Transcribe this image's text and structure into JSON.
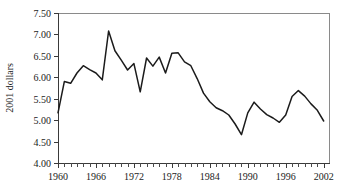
{
  "chart_data": {
    "type": "line",
    "title": "",
    "xlabel": "",
    "ylabel": "2001 dollars",
    "xlim": [
      1960,
      2003
    ],
    "ylim": [
      4.0,
      7.5
    ],
    "grid": false,
    "legend": false,
    "y_tick_labels": [
      "7.50",
      "7.00",
      "6.50",
      "6.00",
      "5.50",
      "5.00",
      "4.50",
      "4.00"
    ],
    "y_tick_values": [
      7.5,
      7.0,
      6.5,
      6.0,
      5.5,
      5.0,
      4.5,
      4.0
    ],
    "x_tick_labels": [
      "1960",
      "1966",
      "1972",
      "1978",
      "1984",
      "1990",
      "1996",
      "2002"
    ],
    "x_tick_values": [
      1960,
      1966,
      1972,
      1978,
      1984,
      1990,
      1996,
      2002
    ],
    "x_minor_tick_step": 1,
    "line_color": "#1b1b1b",
    "x": [
      1960,
      1961,
      1962,
      1963,
      1964,
      1965,
      1966,
      1967,
      1968,
      1969,
      1970,
      1971,
      1972,
      1973,
      1974,
      1975,
      1976,
      1977,
      1978,
      1979,
      1980,
      1981,
      1982,
      1983,
      1984,
      1985,
      1986,
      1987,
      1988,
      1989,
      1990,
      1991,
      1992,
      1993,
      1994,
      1995,
      1996,
      1997,
      1998,
      1999,
      2000,
      2001,
      2002
    ],
    "values": [
      5.17,
      5.9,
      5.86,
      6.1,
      6.27,
      6.18,
      6.1,
      5.94,
      7.08,
      6.62,
      6.4,
      6.17,
      6.32,
      5.66,
      6.45,
      6.26,
      6.47,
      6.1,
      6.56,
      6.57,
      6.36,
      6.27,
      5.97,
      5.63,
      5.43,
      5.29,
      5.22,
      5.12,
      4.91,
      4.66,
      5.17,
      5.42,
      5.26,
      5.13,
      5.05,
      4.95,
      5.12,
      5.55,
      5.69,
      5.56,
      5.38,
      5.23,
      4.98
    ],
    "series": [
      {
        "name": "2001 dollars",
        "values": [
          5.17,
          5.9,
          5.86,
          6.1,
          6.27,
          6.18,
          6.1,
          5.94,
          7.08,
          6.62,
          6.4,
          6.17,
          6.32,
          5.66,
          6.45,
          6.26,
          6.47,
          6.1,
          6.56,
          6.57,
          6.36,
          6.27,
          5.97,
          5.63,
          5.43,
          5.29,
          5.22,
          5.12,
          4.91,
          4.66,
          5.17,
          5.42,
          5.26,
          5.13,
          5.05,
          4.95,
          5.12,
          5.55,
          5.69,
          5.56,
          5.38,
          5.23,
          4.98
        ]
      }
    ]
  }
}
